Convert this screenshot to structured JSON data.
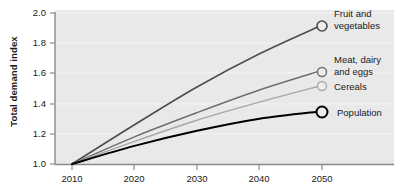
{
  "chart_data": {
    "type": "line",
    "title": "",
    "xlabel": "",
    "ylabel": "Total demand index",
    "x": [
      2010,
      2020,
      2030,
      2040,
      2050
    ],
    "xtick_labels": [
      "2010",
      "2020",
      "2030",
      "2040",
      "2050"
    ],
    "ytick_labels": [
      "1.0",
      "1.2",
      "1.4",
      "1.6",
      "1.8",
      "2.0"
    ],
    "ytick_values": [
      1.0,
      1.2,
      1.4,
      1.6,
      1.8,
      2.0
    ],
    "xlim": [
      2010,
      2050
    ],
    "ylim": [
      1.0,
      2.0
    ],
    "grid": true,
    "legend_position": "right-inline-endpoint-labels",
    "series": [
      {
        "name": "Fruit and vegetables",
        "label_line1": "Fruit and",
        "label_line2": "vegetables",
        "color": "#4d4d4d",
        "values": [
          1.0,
          1.26,
          1.51,
          1.73,
          1.92
        ],
        "end_value": 1.92,
        "marker": "open-circle"
      },
      {
        "name": "Meat, dairy and eggs",
        "label_line1": "Meat, dairy",
        "label_line2": "and eggs",
        "color": "#6e6e6e",
        "values": [
          1.0,
          1.18,
          1.34,
          1.49,
          1.62
        ],
        "end_value": 1.62,
        "marker": "open-circle"
      },
      {
        "name": "Cereals",
        "label_line1": "Cereals",
        "label_line2": "",
        "color": "#a8a8a8",
        "values": [
          1.0,
          1.15,
          1.29,
          1.41,
          1.52
        ],
        "end_value": 1.52,
        "marker": "open-circle"
      },
      {
        "name": "Population",
        "label_line1": "Population",
        "label_line2": "",
        "color": "#000000",
        "values": [
          1.0,
          1.12,
          1.22,
          1.3,
          1.35
        ],
        "end_value": 1.35,
        "marker": "open-circle"
      }
    ],
    "axis_color": "#8a8a8a",
    "gridline_color": "#f4f4f4",
    "plot_background": "#e9e9e9",
    "page_background": "#ffffff"
  }
}
